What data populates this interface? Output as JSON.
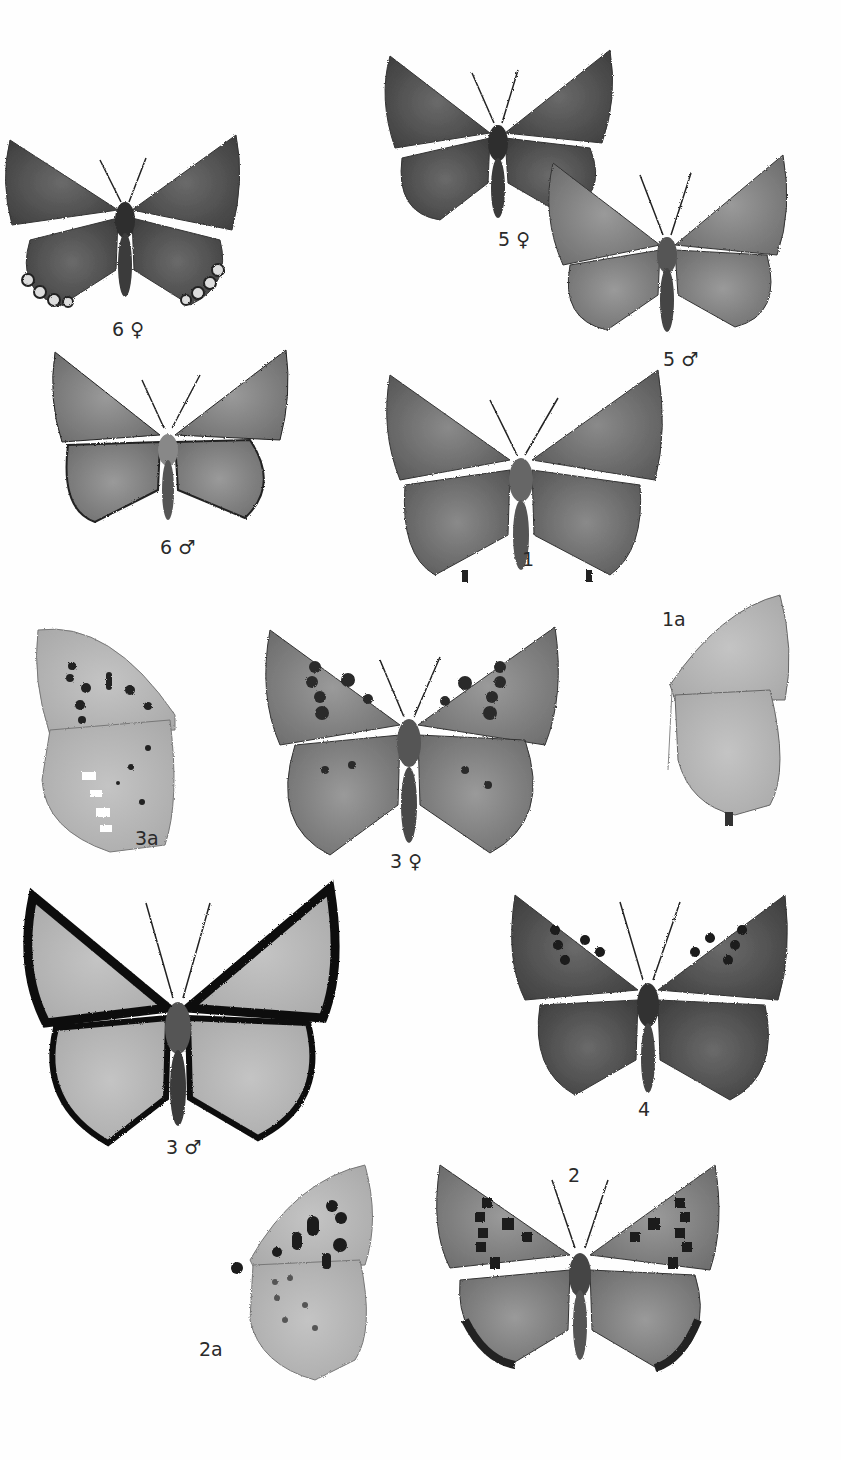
{
  "plate": {
    "figures": [
      {
        "id": "6f",
        "label": "6 ♀",
        "view": "upperside",
        "tone": "dark",
        "features": [
          "submarginal ocelli on hindwing"
        ]
      },
      {
        "id": "5f",
        "label": "5 ♀",
        "view": "upperside",
        "tone": "dark"
      },
      {
        "id": "5m",
        "label": "5 ♂",
        "view": "upperside",
        "tone": "medium"
      },
      {
        "id": "6m",
        "label": "6 ♂",
        "view": "upperside",
        "tone": "medium"
      },
      {
        "id": "1",
        "label": "1",
        "view": "upperside",
        "tone": "medium-dark",
        "features": [
          "hindwing tails"
        ]
      },
      {
        "id": "1a",
        "label": "1a",
        "view": "underside",
        "tone": "light"
      },
      {
        "id": "3a",
        "label": "3a",
        "view": "underside",
        "tone": "light",
        "features": [
          "black spots",
          "white submarginal marks"
        ]
      },
      {
        "id": "3f",
        "label": "3 ♀",
        "view": "upperside",
        "tone": "medium",
        "features": [
          "black spots"
        ]
      },
      {
        "id": "3m",
        "label": "3 ♂",
        "view": "upperside",
        "tone": "light",
        "features": [
          "dark broad borders"
        ]
      },
      {
        "id": "4",
        "label": "4",
        "view": "upperside",
        "tone": "dark",
        "features": [
          "black spots"
        ]
      },
      {
        "id": "2a",
        "label": "2a",
        "view": "underside",
        "tone": "light",
        "features": [
          "black spots"
        ]
      },
      {
        "id": "2",
        "label": "2",
        "view": "upperside",
        "tone": "medium",
        "features": [
          "black spots",
          "dark hindwing border"
        ]
      }
    ]
  }
}
